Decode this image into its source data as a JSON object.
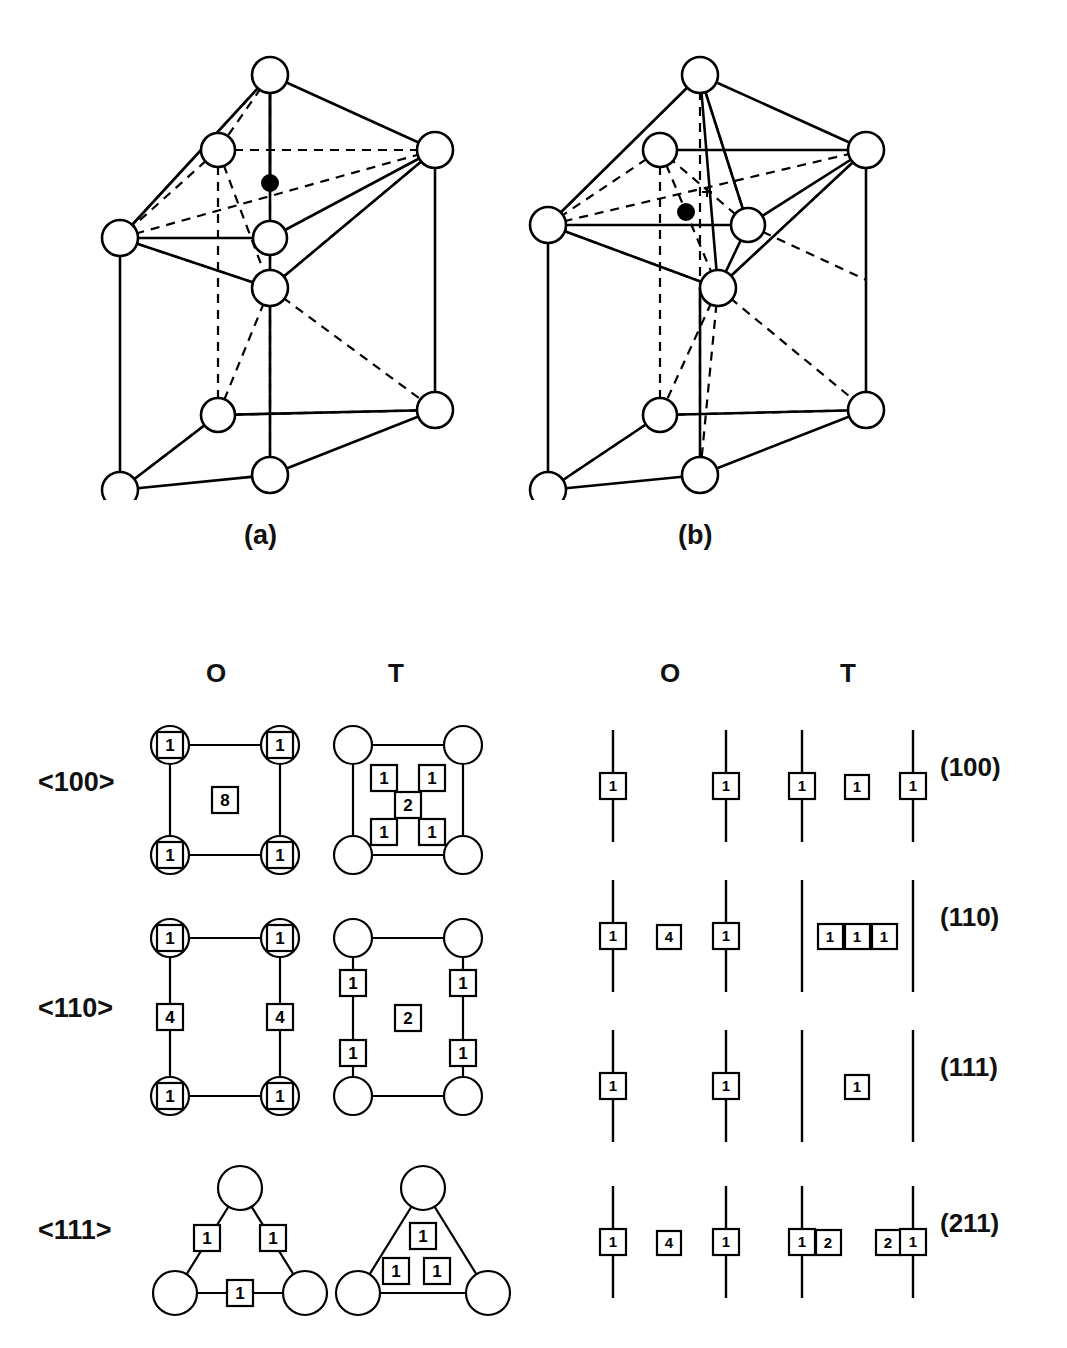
{
  "figure": {
    "type": "crystal-structure-diagram",
    "panels": [
      {
        "id": "a",
        "label": "(a)",
        "caption_x": 262,
        "caption_y": 522
      },
      {
        "id": "b",
        "label": "(b)",
        "caption_x": 692,
        "caption_y": 522
      }
    ]
  },
  "unit_cells": {
    "panel_a": {
      "label": "(a)",
      "site_type": "octahedral",
      "open_circle_count": 9,
      "filled_circle_count": 1,
      "description": "BCC unit cell with octahedral interstitial site marked by filled circle"
    },
    "panel_b": {
      "label": "(b)",
      "site_type": "tetrahedral",
      "open_circle_count": 9,
      "filled_circle_count": 1,
      "description": "BCC unit cell with tetrahedral interstitial site marked by filled circle"
    }
  },
  "lower_left_table": {
    "column_headers": [
      "O",
      "T"
    ],
    "header_positions": {
      "o_x": 215,
      "t_x": 396
    },
    "rows": [
      {
        "direction": "<100>",
        "o": {
          "shape": "square",
          "corner_circles": 4,
          "corner_box_values": [
            "1",
            "1",
            "1",
            "1"
          ],
          "center_box_values": [
            "8"
          ]
        },
        "t": {
          "shape": "square",
          "corner_circles": 4,
          "corner_box_values": [],
          "inner_box_values": [
            "1",
            "1",
            "2",
            "1",
            "1"
          ]
        }
      },
      {
        "direction": "<110>",
        "o": {
          "shape": "rectangle",
          "corner_circles": 4,
          "corner_box_values": [
            "1",
            "1",
            "1",
            "1"
          ],
          "edge_box_values": [
            "4",
            "4"
          ]
        },
        "t": {
          "shape": "rectangle",
          "corner_circles": 4,
          "edge_box_values": [
            "1",
            "1",
            "1",
            "1"
          ],
          "center_box_values": [
            "2"
          ]
        }
      },
      {
        "direction": "<111>",
        "o": {
          "shape": "triangle",
          "corner_circles": 3,
          "edge_box_values": [
            "1",
            "1",
            "1"
          ]
        },
        "t": {
          "shape": "triangle",
          "corner_circles": 3,
          "inner_box_values": [
            "1",
            "1",
            "1"
          ]
        }
      }
    ]
  },
  "lower_right_table": {
    "column_headers": [
      "O",
      "T"
    ],
    "header_positions": {
      "o_x": 670,
      "t_x": 850
    },
    "rows": [
      {
        "plane": "(100)",
        "o_lines": [
          {
            "x": 613,
            "boxes": [
              {
                "value": "1",
                "x": 613
              }
            ]
          },
          {
            "x": 726,
            "boxes": [
              {
                "value": "1",
                "x": 726
              }
            ]
          }
        ],
        "o_free_boxes": [],
        "t_lines": [
          {
            "x": 802,
            "boxes": [
              {
                "value": "1",
                "x": 802
              }
            ]
          },
          {
            "x": 913,
            "boxes": [
              {
                "value": "1",
                "x": 913
              }
            ]
          }
        ],
        "t_free_boxes": [
          {
            "value": "1",
            "x": 858
          }
        ]
      },
      {
        "plane": "(110)",
        "o_lines": [
          {
            "x": 613,
            "boxes": [
              {
                "value": "1",
                "x": 613
              }
            ]
          },
          {
            "x": 726,
            "boxes": [
              {
                "value": "1",
                "x": 726
              }
            ]
          }
        ],
        "o_free_boxes": [
          {
            "value": "4",
            "x": 669
          }
        ],
        "t_lines": [
          {
            "x": 802,
            "boxes": []
          },
          {
            "x": 913,
            "boxes": []
          }
        ],
        "t_free_boxes": [
          {
            "value": "1",
            "x": 830
          },
          {
            "value": "1",
            "x": 857
          },
          {
            "value": "1",
            "x": 884
          }
        ]
      },
      {
        "plane": "(111)",
        "o_lines": [
          {
            "x": 613,
            "boxes": [
              {
                "value": "1",
                "x": 613
              }
            ]
          },
          {
            "x": 726,
            "boxes": [
              {
                "value": "1",
                "x": 726
              }
            ]
          }
        ],
        "o_free_boxes": [],
        "t_lines": [
          {
            "x": 802,
            "boxes": []
          },
          {
            "x": 913,
            "boxes": []
          }
        ],
        "t_free_boxes": [
          {
            "value": "1",
            "x": 858
          }
        ]
      },
      {
        "plane": "(211)",
        "o_lines": [
          {
            "x": 613,
            "boxes": [
              {
                "value": "1",
                "x": 613
              }
            ]
          },
          {
            "x": 726,
            "boxes": [
              {
                "value": "1",
                "x": 726
              }
            ]
          }
        ],
        "o_free_boxes": [
          {
            "value": "4",
            "x": 669
          }
        ],
        "t_lines": [
          {
            "x": 802,
            "boxes": [
              {
                "value": "1",
                "x": 802
              }
            ]
          },
          {
            "x": 913,
            "boxes": [
              {
                "value": "1",
                "x": 913
              }
            ]
          }
        ],
        "t_free_boxes": [
          {
            "value": "2",
            "x": 828
          },
          {
            "value": "2",
            "x": 888
          }
        ]
      }
    ]
  },
  "colors": {
    "stroke": "#000000",
    "fill_open": "#ffffff",
    "fill_solid": "#000000",
    "background": "#ffffff"
  }
}
